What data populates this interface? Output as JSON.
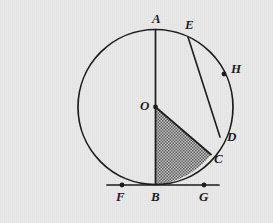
{
  "figure": {
    "kind": "geometry-diagram",
    "canvas": {
      "width": 273,
      "height": 223
    },
    "colors": {
      "background": "#e9e9e9",
      "stroke": "#1d1d1d",
      "label": "#1d1d1d",
      "shade_fill": "#b9b9b9",
      "shade_dot": "#4a4a4a"
    }
  },
  "circle": {
    "name": "main-circle",
    "center": {
      "x": 155.5,
      "y": 107
    },
    "radius": 77.5,
    "stroke_width": 1.7
  },
  "segments": [
    {
      "name": "diameter-AB",
      "from": "A",
      "to": "B",
      "x1": 155.5,
      "y1": 29.5,
      "x2": 155.5,
      "y2": 184.5,
      "stroke_width": 1.7
    },
    {
      "name": "chord-ED",
      "from": "E",
      "to": "D",
      "x1": 188.0,
      "y1": 37.0,
      "x2": 220.0,
      "y2": 137.0,
      "stroke_width": 1.6
    },
    {
      "name": "radius-OC",
      "from": "O",
      "to": "C",
      "x1": 155.5,
      "y1": 107.0,
      "x2": 211.0,
      "y2": 154.5,
      "stroke_width": 1.7
    },
    {
      "name": "tangent-FG",
      "from": "F",
      "to": "G",
      "x1": 107.0,
      "y1": 185.0,
      "x2": 219.0,
      "y2": 185.0,
      "stroke_width": 1.7
    }
  ],
  "shaded_region": {
    "name": "region-OBC",
    "description": "Region bounded by radius OB, radius OC and minor arc BC",
    "fill_pattern": "dotted-stipple",
    "vertices": [
      "O",
      "B",
      "C"
    ],
    "arc": {
      "from": "B",
      "to": "C",
      "radius": 77.5
    }
  },
  "points": [
    {
      "id": "A",
      "label": "A",
      "x": 155.5,
      "y": 29.5,
      "label_x": 152,
      "label_y": 12,
      "dot": false,
      "on": "circle"
    },
    {
      "id": "E",
      "label": "E",
      "x": 188.0,
      "y": 37.0,
      "label_x": 185,
      "label_y": 18,
      "dot": false,
      "on": "circle"
    },
    {
      "id": "H",
      "label": "H",
      "x": 224.0,
      "y": 74.0,
      "label_x": 231,
      "label_y": 62,
      "dot": true,
      "on": "circle"
    },
    {
      "id": "D",
      "label": "D",
      "x": 220.0,
      "y": 137.0,
      "label_x": 227,
      "label_y": 130,
      "dot": false,
      "on": "circle"
    },
    {
      "id": "C",
      "label": "C",
      "x": 211.0,
      "y": 154.5,
      "label_x": 214,
      "label_y": 152,
      "dot": false,
      "on": "circle"
    },
    {
      "id": "O",
      "label": "O",
      "x": 155.5,
      "y": 107.0,
      "label_x": 140,
      "label_y": 99,
      "dot": true,
      "on": "center"
    },
    {
      "id": "B",
      "label": "B",
      "x": 155.5,
      "y": 184.5,
      "label_x": 151,
      "label_y": 190,
      "dot": false,
      "on": "circle"
    },
    {
      "id": "F",
      "label": "F",
      "x": 122.0,
      "y": 185.0,
      "label_x": 116,
      "label_y": 190,
      "dot": true,
      "on": "tangent"
    },
    {
      "id": "G",
      "label": "G",
      "x": 204.0,
      "y": 185.0,
      "label_x": 199,
      "label_y": 190,
      "dot": true,
      "on": "tangent"
    }
  ]
}
